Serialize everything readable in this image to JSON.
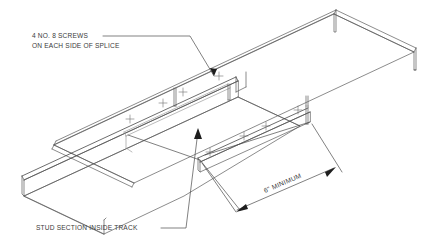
{
  "drawing": {
    "title": "Track splice isometric detail",
    "background_color": "#ffffff",
    "line_color": "#5a5a5a",
    "text_color": "#3a3a3a",
    "annotations": {
      "screws_note": {
        "line1": "4 NO. 8 SCREWS",
        "line2": "ON EACH SIDE OF SPLICE"
      },
      "stud_note": {
        "line1": "STUD SECTION INSIDE TRACK"
      },
      "dimension": {
        "label": "6\" MINIMUM"
      }
    },
    "components": {
      "upper_track": "upper-track-channel",
      "lower_track": "lower-track-channel",
      "stud_section": "stud-section",
      "splice_joint": "splice-joint"
    },
    "screw_marks": {
      "symbol": "+",
      "upper_row_count": 4,
      "lower_row_count": 4
    }
  }
}
